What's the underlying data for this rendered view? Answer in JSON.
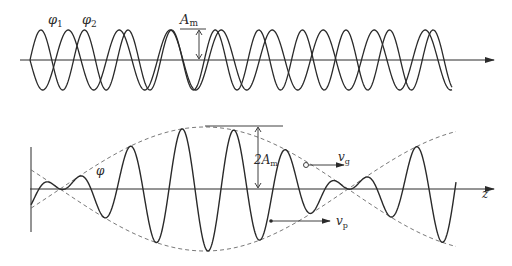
{
  "figure": {
    "title": "",
    "top_panel": {
      "description": "Two sinusoidal waves of slightly different wavenumber superposed along an axis",
      "labels": {
        "phi1": "φ",
        "phi1_sub": "1",
        "phi2": "φ",
        "phi2_sub": "2",
        "amplitude": "A",
        "amplitude_sub": "m"
      },
      "axis": {
        "y": 60,
        "x_start": 20,
        "x_end": 492,
        "arrow": true
      },
      "wave": {
        "x_start": 30,
        "x_end": 452,
        "amplitude_px": 30,
        "mean_period_px": 47,
        "in_phase_at_x": 180
      }
    },
    "bottom_panel": {
      "description": "Resulting wave packet with dashed envelope showing group and phase velocity",
      "labels": {
        "phi": "φ",
        "double_amplitude": "2A",
        "double_amplitude_sub": "m",
        "vg": "v",
        "vg_sub": "g",
        "vp": "v",
        "vp_sub": "p",
        "axis": "z"
      },
      "axis": {
        "y": 189,
        "x_start": 30,
        "x_end": 492,
        "arrow": true
      },
      "vertical_axis": {
        "x": 31,
        "y_top": 147,
        "y_bottom": 232
      },
      "envelope": {
        "max_amplitude_px": 62,
        "max_at_x": 205,
        "node_x": [
          60,
          348
        ],
        "style": "dashed"
      },
      "carrier": {
        "period_px": 52,
        "x_start": 31,
        "x_end": 456
      }
    },
    "colors": {
      "line": "#2a2a2a",
      "dashed": "#6a6a6a",
      "background": "#ffffff"
    }
  }
}
